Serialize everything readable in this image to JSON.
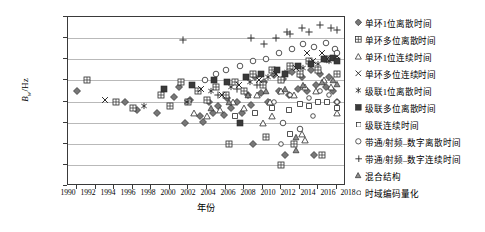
{
  "chart_data": {
    "type": "scatter",
    "title": "",
    "xlabel": "年份",
    "ylabel": "Bw/Hz",
    "ylabel_symbol": "B",
    "ylabel_sub": "w",
    "ylabel_unit": "/Hz",
    "xlim": [
      1989,
      2019
    ],
    "ylim": [
      1,
      9
    ],
    "y_scale": "log",
    "grid": true,
    "legend_position": "right",
    "x_ticks": [
      1990,
      1992,
      1994,
      1996,
      1998,
      2000,
      2002,
      2004,
      2006,
      2008,
      2010,
      2012,
      2014,
      2016,
      2018
    ],
    "y_ticks": [
      {
        "label": "1×10",
        "exp": "1",
        "value": 10
      },
      {
        "label": "1×10",
        "exp": "2",
        "value": 100
      },
      {
        "label": "1×10",
        "exp": "3",
        "value": 1000
      },
      {
        "label": "1×10",
        "exp": "4",
        "value": 10000
      },
      {
        "label": "1×10",
        "exp": "5",
        "value": 100000
      },
      {
        "label": "1×10",
        "exp": "6",
        "value": 1000000
      },
      {
        "label": "1×10",
        "exp": "7",
        "value": 10000000
      },
      {
        "label": "1×10",
        "exp": "8",
        "value": 100000000
      },
      {
        "label": "1×10",
        "exp": "9",
        "value": 1000000000
      }
    ],
    "series": [
      {
        "name": "单环1位离散时间",
        "marker": "diamond-filled",
        "points": [
          [
            1990,
            330000.0
          ],
          [
            1995.2,
            100000.0
          ],
          [
            2000.4,
            170000.0
          ],
          [
            2001.0,
            500000.0
          ],
          [
            2002.2,
            120000.0
          ],
          [
            2003.2,
            20000.0
          ],
          [
            2003.6,
            11000.0
          ],
          [
            2004.2,
            90000.0
          ],
          [
            2004.6,
            30000.0
          ],
          [
            2005.2,
            60000.0
          ],
          [
            2005.8,
            22000.0
          ],
          [
            2006.2,
            150000.0
          ],
          [
            2006.6,
            50000.0
          ],
          [
            2007.2,
            100000.0
          ],
          [
            2007.8,
            30000.0
          ],
          [
            2008.4,
            200000.0
          ],
          [
            2008.8,
            70000.0
          ],
          [
            2009.2,
            1400000.0
          ],
          [
            2009.8,
            250000.0
          ],
          [
            2010.2,
            800000.0
          ],
          [
            2010.6,
            100000.0
          ],
          [
            2011.2,
            1800000.0
          ],
          [
            2011.8,
            300000.0
          ],
          [
            2012.2,
            1200000.0
          ],
          [
            2012.8,
            200000.0
          ],
          [
            2013.2,
            2500000.0
          ],
          [
            2013.8,
            400000.0
          ],
          [
            2014.2,
            1500000.0
          ],
          [
            2014.8,
            300000.0
          ],
          [
            2015.2,
            3000000.0
          ],
          [
            2015.8,
            600000.0
          ],
          [
            2016.2,
            2000000.0
          ],
          [
            2016.8,
            500000.0
          ],
          [
            2017.2,
            1500000.0
          ],
          [
            1996.4,
            40000.0
          ],
          [
            1998.6,
            30000.0
          ],
          [
            2001.6,
            10000.0
          ],
          [
            2009.0,
            1000.0
          ],
          [
            2012.4,
            300.0
          ],
          [
            2015.6,
            300.0
          ],
          [
            2017.6,
            300000.0
          ],
          [
            2018.0,
            100000.0
          ]
        ]
      },
      {
        "name": "单环多位离散时间",
        "marker": "square-grid",
        "points": [
          [
            1991.0,
            1000000.0
          ],
          [
            1994.2,
            100000.0
          ],
          [
            1996.0,
            50000.0
          ],
          [
            1999.0,
            200000.0
          ],
          [
            2000.0,
            60000.0
          ],
          [
            2001.2,
            800000.0
          ],
          [
            2002.0,
            100000.0
          ],
          [
            2003.0,
            300000.0
          ],
          [
            2004.0,
            120000.0
          ],
          [
            2005.0,
            500000.0
          ],
          [
            2006.0,
            200000.0
          ],
          [
            2007.0,
            800000.0
          ],
          [
            2008.0,
            300000.0
          ],
          [
            2009.0,
            2000000.0
          ],
          [
            2010.0,
            600000.0
          ],
          [
            2011.0,
            3000000.0
          ],
          [
            2012.0,
            1000000.0
          ],
          [
            2013.0,
            5000000.0
          ],
          [
            2014.0,
            2000000.0
          ],
          [
            2015.0,
            8000000.0
          ],
          [
            2016.0,
            3000000.0
          ],
          [
            2017.0,
            10000000.0
          ],
          [
            2006.4,
            1000.0
          ],
          [
            2013.4,
            1000.0
          ],
          [
            2010.4,
            2000.0
          ],
          [
            2016.4,
            300.0
          ],
          [
            2012.0,
            100.0
          ],
          [
            2018.0,
            2000000.0
          ]
        ]
      },
      {
        "name": "单环1位连续时间",
        "marker": "triangle-open",
        "points": [
          [
            2002.6,
            30000.0
          ],
          [
            2004.0,
            20000.0
          ],
          [
            2005.4,
            40000.0
          ],
          [
            2006.8,
            100000.0
          ],
          [
            2008.0,
            50000.0
          ],
          [
            2009.4,
            200000.0
          ],
          [
            2010.8,
            100000.0
          ],
          [
            2012.0,
            300000.0
          ],
          [
            2013.4,
            200000.0
          ],
          [
            2014.6,
            500000.0
          ],
          [
            2015.8,
            300000.0
          ],
          [
            2016.6,
            1000000.0
          ],
          [
            2017.4,
            500000.0
          ],
          [
            2014.2,
            3000.0
          ],
          [
            2014.6,
            1500.0
          ],
          [
            2010.0,
            10000.0
          ],
          [
            2011.0,
            20000.0
          ],
          [
            2018.0,
            30000.0
          ]
        ]
      },
      {
        "name": "单环多位连续时间",
        "marker": "cross-x",
        "points": [
          [
            1993.0,
            120000.0
          ],
          [
            2003.4,
            400000.0
          ],
          [
            2005.6,
            200000.0
          ],
          [
            2007.4,
            600000.0
          ],
          [
            2009.6,
            1000000.0
          ],
          [
            2011.4,
            2000000.0
          ],
          [
            2013.6,
            4000000.0
          ],
          [
            2014.8,
            20000000.0
          ],
          [
            2015.4,
            8000000.0
          ],
          [
            2016.4,
            20000000.0
          ],
          [
            2017.0,
            10000000.0
          ],
          [
            2018.0,
            15000000.0
          ]
        ]
      },
      {
        "name": "级联1位离散时间",
        "marker": "asterisk",
        "points": [
          [
            1997.2,
            60000.0
          ],
          [
            2001.8,
            100000.0
          ],
          [
            2004.4,
            300000.0
          ],
          [
            2006.6,
            500000.0
          ],
          [
            2008.6,
            800000.0
          ],
          [
            2010.6,
            1500000.0
          ],
          [
            2012.6,
            2500000.0
          ],
          [
            2014.4,
            4000000.0
          ],
          [
            2016.0,
            6000000.0
          ],
          [
            2017.2,
            8000000.0
          ]
        ]
      },
      {
        "name": "级联多位离散时间",
        "marker": "square-filled",
        "points": [
          [
            1999.4,
            400000.0
          ],
          [
            2002.4,
            600000.0
          ],
          [
            2004.8,
            1000000.0
          ],
          [
            2006.2,
            800000.0
          ],
          [
            2008.2,
            1500000.0
          ],
          [
            2009.8,
            2000000.0
          ],
          [
            2011.6,
            3000000.0
          ],
          [
            2012.4,
            2000000.0
          ],
          [
            2013.8,
            5000000.0
          ],
          [
            2015.2,
            6000000.0
          ],
          [
            2016.6,
            10000000.0
          ],
          [
            2017.6,
            12000000.0
          ],
          [
            2007.6,
            10000.0
          ],
          [
            2018.0,
            8000000.0
          ]
        ]
      },
      {
        "name": "级联连续时间",
        "marker": "square-small",
        "points": [
          [
            2007.0,
            20000.0
          ],
          [
            2009.2,
            30000.0
          ],
          [
            2011.0,
            50000.0
          ],
          [
            2012.8,
            40000.0
          ],
          [
            2014.0,
            80000.0
          ],
          [
            2015.0,
            60000.0
          ],
          [
            2016.0,
            100000.0
          ],
          [
            2017.0,
            90000.0
          ],
          [
            2013.0,
            3000.0
          ],
          [
            2018.0,
            50000.0
          ]
        ]
      },
      {
        "name": "带通/射频–数字离散时间",
        "marker": "circle-open",
        "points": [
          [
            2003.8,
            1000000.0
          ],
          [
            2005.0,
            2000000.0
          ],
          [
            2006.0,
            3000000.0
          ],
          [
            2007.6,
            5000000.0
          ],
          [
            2009.0,
            8000000.0
          ],
          [
            2010.4,
            10000000.0
          ],
          [
            2011.8,
            20000000.0
          ],
          [
            2013.2,
            30000000.0
          ],
          [
            2014.4,
            50000000.0
          ],
          [
            2015.6,
            40000000.0
          ],
          [
            2016.8,
            60000000.0
          ],
          [
            2017.8,
            30000000.0
          ],
          [
            2012.2,
            10000.0
          ],
          [
            2014.0,
            5000.0
          ],
          [
            2018.0,
            20000000.0
          ]
        ]
      },
      {
        "name": "带通/射频–数字连续时间",
        "marker": "plus",
        "points": [
          [
            2001.4,
            80000000.0
          ],
          [
            2008.8,
            100000000.0
          ],
          [
            2010.2,
            50000000.0
          ],
          [
            2011.4,
            100000000.0
          ],
          [
            2012.6,
            200000000.0
          ],
          [
            2013.0,
            150000000.0
          ],
          [
            2014.2,
            300000000.0
          ],
          [
            2015.0,
            200000000.0
          ],
          [
            2016.2,
            400000000.0
          ],
          [
            2017.4,
            300000000.0
          ],
          [
            2018.0,
            250000000.0
          ],
          [
            2005.2,
            200000.0
          ],
          [
            2007.2,
            400000.0
          ],
          [
            2009.4,
            600000.0
          ]
        ]
      },
      {
        "name": "混合结构",
        "marker": "triangle-small",
        "points": [
          [
            2004.4,
            50000.0
          ],
          [
            2006.4,
            100000.0
          ],
          [
            2008.4,
            200000.0
          ],
          [
            2010.4,
            300000.0
          ],
          [
            2012.4,
            400000.0
          ],
          [
            2014.4,
            600000.0
          ],
          [
            2016.4,
            800000.0
          ],
          [
            2017.6,
            1000000.0
          ],
          [
            2013.6,
            2000.0
          ],
          [
            2013.6,
            500.0
          ],
          [
            2018.0,
            700000.0
          ]
        ]
      },
      {
        "name": "时域编码量化",
        "marker": "circle-small",
        "points": [
          [
            2011.2,
            100000.0
          ],
          [
            2013.0,
            200000.0
          ],
          [
            2015.0,
            150000.0
          ],
          [
            2016.2,
            300000.0
          ],
          [
            2017.2,
            200000.0
          ],
          [
            2015.4,
            20000.0
          ],
          [
            2012.0,
            1000.0
          ],
          [
            2018.0,
            100000.0
          ]
        ]
      }
    ]
  }
}
